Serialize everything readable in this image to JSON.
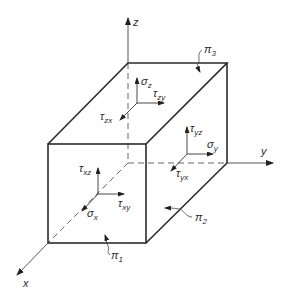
{
  "diagram": {
    "type": "3D stress element (cube) with coordinate axes",
    "axes": {
      "x": {
        "label": "x"
      },
      "y": {
        "label": "y"
      },
      "z": {
        "label": "z"
      }
    },
    "faces": {
      "front": {
        "plane_label": "π",
        "plane_sub": "1",
        "normal_stress": {
          "sym": "σ",
          "sub": "x"
        },
        "shear_1": {
          "sym": "τ",
          "sub": "xy"
        },
        "shear_2": {
          "sym": "τ",
          "sub": "xz"
        }
      },
      "right": {
        "plane_label": "π",
        "plane_sub": "2",
        "normal_stress": {
          "sym": "σ",
          "sub": "y"
        },
        "shear_1": {
          "sym": "τ",
          "sub": "yx"
        },
        "shear_2": {
          "sym": "τ",
          "sub": "yz"
        }
      },
      "top": {
        "plane_label": "π",
        "plane_sub": "3",
        "normal_stress": {
          "sym": "σ",
          "sub": "z"
        },
        "shear_1": {
          "sym": "τ",
          "sub": "zx"
        },
        "shear_2": {
          "sym": "τ",
          "sub": "zy"
        }
      }
    },
    "colors": {
      "line": "#2b2b2b",
      "background": "#ffffff"
    }
  }
}
